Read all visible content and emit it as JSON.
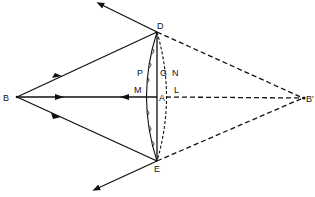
{
  "diagram": {
    "type": "optics-refraction-wavefront",
    "labels": {
      "B": "B",
      "B_prime": "B'",
      "D": "D",
      "E": "E",
      "A": "A",
      "M": "M",
      "P": "P",
      "G": "G",
      "N": "N",
      "L": "L"
    },
    "colors": {
      "ink": "#111111",
      "background": "#ffffff"
    }
  }
}
